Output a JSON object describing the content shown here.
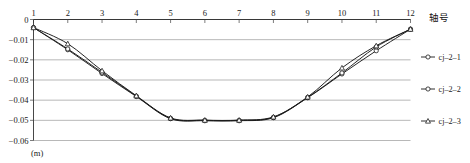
{
  "chart_data": {
    "type": "line",
    "title": "",
    "xlabel": "轴号",
    "ylabel": "(m)",
    "x": [
      1,
      2,
      3,
      4,
      5,
      6,
      7,
      8,
      9,
      10,
      11,
      12
    ],
    "xlim": [
      1,
      12
    ],
    "ylim": [
      -0.06,
      0
    ],
    "x_axis_position": "top",
    "grid": true,
    "gridlines_horizontal": [
      0,
      -0.01,
      -0.02,
      -0.03,
      -0.04,
      -0.05,
      -0.06
    ],
    "legend_position": "right",
    "xticklabels": [
      "1",
      "2",
      "3",
      "4",
      "5",
      "6",
      "7",
      "8",
      "9",
      "10",
      "11",
      "12"
    ],
    "yticklabels": [
      "0",
      "-0.01",
      "-0.02",
      "-0.03",
      "-0.04",
      "-0.05",
      "-0.06"
    ],
    "yticks": [
      0,
      -0.01,
      -0.02,
      -0.03,
      -0.04,
      -0.05,
      -0.06
    ],
    "marker": "open-circle",
    "series": [
      {
        "name": "cj-2-1",
        "marker": "open-circle",
        "color": "#1a1a1a",
        "values": [
          -0.004,
          -0.015,
          -0.0268,
          -0.0382,
          -0.0492,
          -0.0502,
          -0.0502,
          -0.0487,
          -0.0388,
          -0.027,
          -0.0155,
          -0.0048
        ]
      },
      {
        "name": "cj-2-2",
        "marker": "open-circle",
        "color": "#1a1a1a",
        "values": [
          -0.004,
          -0.0146,
          -0.0262,
          -0.038,
          -0.049,
          -0.05,
          -0.05,
          -0.0485,
          -0.0386,
          -0.0265,
          -0.0136,
          -0.0048
        ]
      },
      {
        "name": "cj-2-3",
        "marker": "open-triangle",
        "color": "#1a1a1a",
        "values": [
          -0.004,
          -0.012,
          -0.0254,
          -0.0378,
          -0.0488,
          -0.0499,
          -0.0499,
          -0.0483,
          -0.0384,
          -0.024,
          -0.013,
          -0.0048
        ]
      }
    ]
  },
  "axis": {
    "x_title": "轴号",
    "y_unit": "(m)"
  },
  "legend": {
    "items": [
      {
        "label": "cj-2-1",
        "marker": "open-circle"
      },
      {
        "label": "cj-2-2",
        "marker": "open-circle"
      },
      {
        "label": "cj-2-3",
        "marker": "open-triangle"
      }
    ]
  }
}
